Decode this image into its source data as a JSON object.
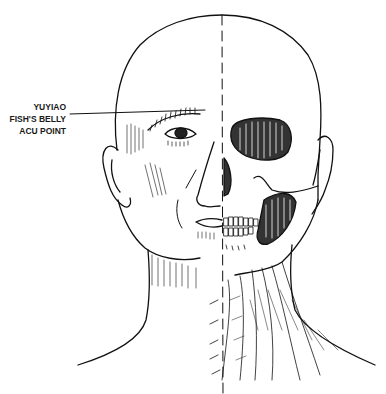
{
  "figure": {
    "label": {
      "lines": [
        "YUYIAO",
        "FISH'S BELLY",
        "ACU POINT"
      ]
    },
    "colors": {
      "ink": "#111111",
      "background": "#ffffff"
    }
  }
}
